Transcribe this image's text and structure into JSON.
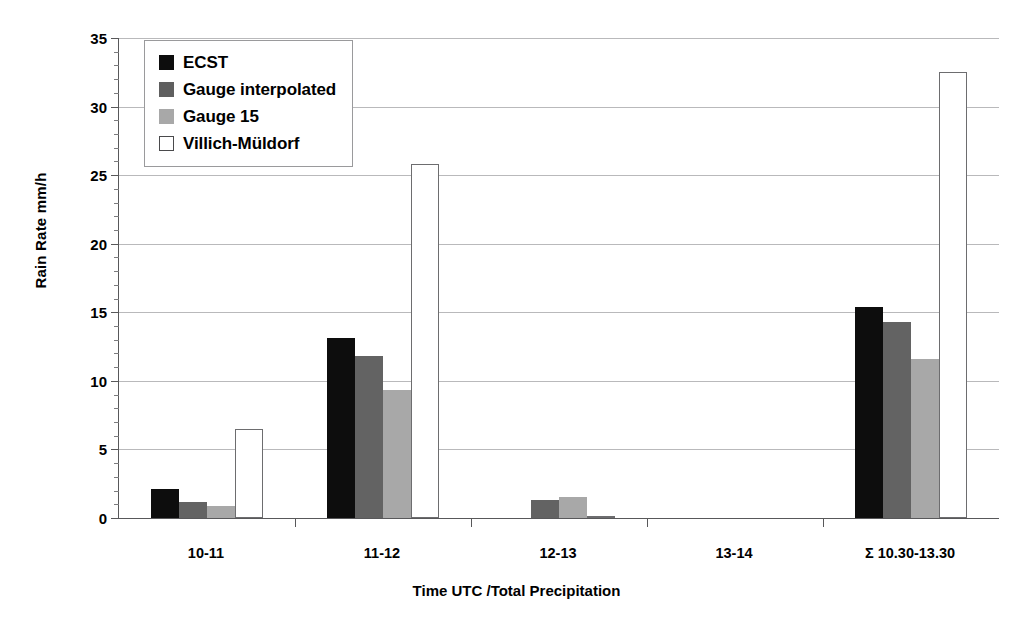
{
  "chart_data": {
    "type": "bar",
    "title": "",
    "xlabel": "Time UTC /Total Precipitation",
    "ylabel": "Rain Rate mm/h",
    "categories": [
      "10-11",
      "11-12",
      "12-13",
      "13-14",
      "Σ 10.30-13.30"
    ],
    "series": [
      {
        "name": "ECST",
        "color": "#0d0d0d",
        "values": [
          2.1,
          13.1,
          0.0,
          0.0,
          15.4
        ]
      },
      {
        "name": "Gauge interpolated",
        "color": "#636363",
        "values": [
          1.2,
          11.8,
          1.3,
          0.0,
          14.3
        ]
      },
      {
        "name": "Gauge 15",
        "color": "#a8a8a8",
        "values": [
          0.9,
          9.3,
          1.5,
          0.0,
          11.6
        ]
      },
      {
        "name": "Villich-Müldorf",
        "color": "#ffffff",
        "values": [
          6.5,
          25.8,
          0.1,
          0.0,
          32.5
        ]
      }
    ],
    "ylim": [
      0,
      35
    ],
    "ytick_step": 5,
    "yticks": [
      0,
      5,
      10,
      15,
      20,
      25,
      30,
      35
    ],
    "ytick_labels": [
      "0",
      "5",
      "10",
      "15",
      "20",
      "25",
      "30",
      "35"
    ],
    "yminor_step": 1,
    "grid": "horizontal",
    "legend_position": "top-left"
  }
}
